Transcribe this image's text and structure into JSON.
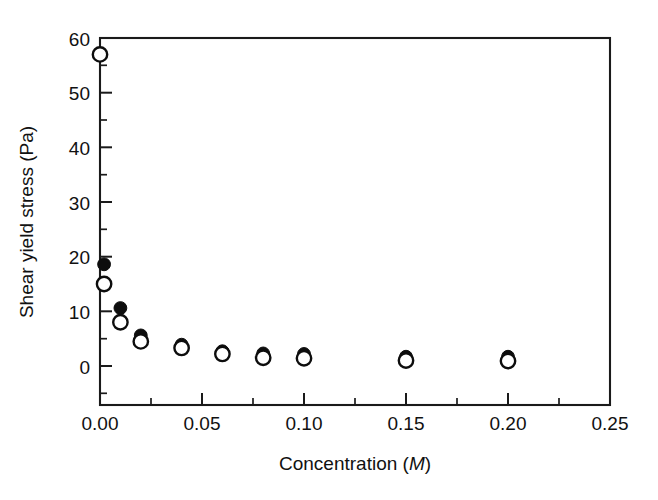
{
  "chart_data": {
    "type": "scatter",
    "title": "",
    "xlabel": "Concentration (M)",
    "xlabel_plain": "Concentration (",
    "xlabel_italic": "M",
    "xlabel_tail": ")",
    "ylabel": "Shear yield stress (Pa)",
    "xlim": [
      0.0,
      0.25
    ],
    "ylim": [
      -7,
      60
    ],
    "y_axis_display_min": 0,
    "y_axis_display_max": 60,
    "grid": false,
    "legend": "none",
    "xticks": [
      0.0,
      0.05,
      0.1,
      0.15,
      0.2,
      0.25
    ],
    "xticklabels": [
      "0.00",
      "0.05",
      "0.10",
      "0.15",
      "0.20",
      "0.25"
    ],
    "x_minor_ticks": [
      0.025,
      0.075,
      0.125,
      0.175,
      0.225
    ],
    "yticks": [
      0,
      10,
      20,
      30,
      40,
      50,
      60
    ],
    "yticklabels": [
      "0",
      "10",
      "20",
      "30",
      "40",
      "50",
      "60"
    ],
    "y_minor_ticks": [
      -5,
      5,
      15,
      25,
      35,
      45,
      55
    ],
    "marker_colors": {
      "open": "#ffffff",
      "open_edge": "#0d0d0d",
      "filled": "#0d0d0d"
    },
    "series": [
      {
        "name": "open circles",
        "marker": "open-circle",
        "x": [
          0.0,
          0.002,
          0.01,
          0.02,
          0.04,
          0.06,
          0.08,
          0.1,
          0.15,
          0.2
        ],
        "y": [
          57.0,
          15.0,
          8.0,
          4.5,
          3.3,
          2.2,
          1.5,
          1.4,
          1.0,
          0.9
        ]
      },
      {
        "name": "filled circles",
        "marker": "filled-circle",
        "x": [
          0.002,
          0.01,
          0.02,
          0.04,
          0.06,
          0.08,
          0.1,
          0.15,
          0.2
        ],
        "y": [
          18.6,
          10.6,
          5.6,
          3.9,
          2.7,
          2.3,
          2.2,
          1.7,
          1.7
        ]
      }
    ]
  },
  "figure": {
    "axis_color": "#1a1a1a",
    "background": "#ffffff"
  }
}
